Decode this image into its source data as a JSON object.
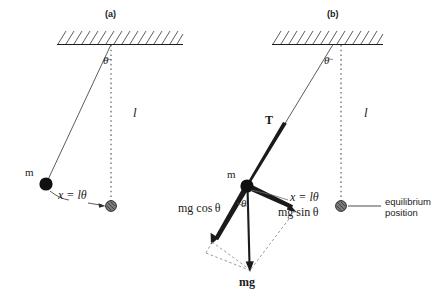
{
  "figure": {
    "title": "",
    "type": "physics-diagram",
    "background_color": "#ffffff",
    "ink_color": "#1a1a1a",
    "panels": [
      {
        "id": "a",
        "tag": "(a)",
        "tag_pos": {
          "x": 105,
          "y": 10
        },
        "description": "pendulum displaced from equilibrium showing arc length x = l theta",
        "ceiling": {
          "x1": 57,
          "x2": 183,
          "y": 44,
          "hatch_count": 16
        },
        "pivot": {
          "x": 111,
          "y": 44
        },
        "bob": {
          "x": 46,
          "y": 184,
          "r": 6.5,
          "fill": "#111111"
        },
        "equilibrium_marker": {
          "x": 111,
          "y": 206,
          "r": 5.5,
          "fill": "#6e6e6e"
        },
        "labels": {
          "angle": "θ",
          "angle_pos": {
            "x": 103,
            "y": 55
          },
          "length": "l",
          "length_pos": {
            "x": 133,
            "y": 106
          },
          "mass": "m",
          "mass_pos": {
            "x": 26,
            "y": 167
          },
          "arc": "x = lθ",
          "arc_pos": {
            "x": 58,
            "y": 190
          }
        }
      },
      {
        "id": "b",
        "tag": "(b)",
        "tag_pos": {
          "x": 327,
          "y": 10
        },
        "description": "free body diagram with tension T and weight mg resolved into mg cos theta and mg sin theta",
        "ceiling": {
          "x1": 272,
          "x2": 383,
          "y": 44,
          "hatch_count": 14
        },
        "pivot": {
          "x": 333,
          "y": 44
        },
        "bob": {
          "x": 247,
          "y": 186,
          "r": 6.5,
          "fill": "#111111"
        },
        "equilibrium_marker": {
          "x": 341,
          "y": 206,
          "r": 5.5,
          "fill": "#6e6e6e"
        },
        "labels": {
          "tension": "T",
          "tension_pos": {
            "x": 266,
            "y": 114
          },
          "angle_top": "θ",
          "angle_top_pos": {
            "x": 325,
            "y": 55
          },
          "length": "l",
          "length_pos": {
            "x": 364,
            "y": 106
          },
          "mass": "m",
          "mass_pos": {
            "x": 228,
            "y": 169
          },
          "angle_bob": "θ",
          "angle_bob_pos": {
            "x": 242,
            "y": 198
          },
          "mg_cos": "mg cos θ",
          "mg_cos_pos": {
            "x": 178,
            "y": 202
          },
          "mg_sin": "mg sin θ",
          "mg_sin_pos": {
            "x": 278,
            "y": 207
          },
          "arc": "x = lθ",
          "arc_pos": {
            "x": 290,
            "y": 192
          },
          "weight": "mg",
          "weight_pos": {
            "x": 240,
            "y": 276
          },
          "equilibrium": "equilibrium",
          "equilibrium_line2": "position",
          "equilibrium_pos": {
            "x": 385,
            "y": 196
          }
        }
      }
    ]
  }
}
